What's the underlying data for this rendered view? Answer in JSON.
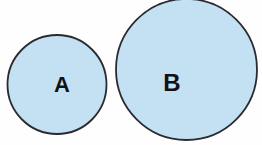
{
  "figure": {
    "background_color": "#fefefe"
  },
  "style": {
    "fill_color": "#c3e1f2",
    "stroke_color": "#2a2a32",
    "label_color": "#111114",
    "stroke_width": 1.8
  },
  "chart_data": {
    "type": "diagram",
    "title": "",
    "xlabel": "",
    "ylabel": "",
    "shapes": [
      {
        "name": "circle-a",
        "label": "A",
        "cx": 57,
        "cy": 84.5,
        "r": 49.5,
        "diameter": 99,
        "fill": "#c3e1f2",
        "stroke": "#2a2a32",
        "label_x": 62,
        "label_y": 84,
        "label_size": 22
      },
      {
        "name": "circle-b",
        "label": "B",
        "cx": 186.5,
        "cy": 69.5,
        "r": 70.5,
        "diameter": 141,
        "fill": "#c3e1f2",
        "stroke": "#2a2a32",
        "label_x": 172,
        "label_y": 82,
        "label_size": 24
      }
    ]
  },
  "labels": {
    "circle_a": "A",
    "circle_b": "B"
  }
}
